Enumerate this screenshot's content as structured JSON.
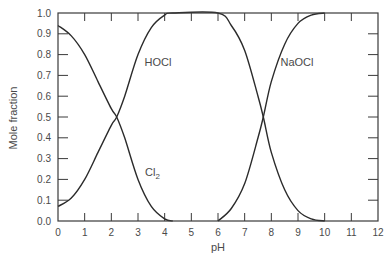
{
  "chart_data": {
    "type": "line",
    "title": "",
    "xlabel": "pH",
    "ylabel": "Mole fraction",
    "xlim": [
      0,
      12
    ],
    "ylim": [
      0.0,
      1.0
    ],
    "x_ticks": [
      "0",
      "1",
      "2",
      "3",
      "4",
      "5",
      "6",
      "7",
      "8",
      "9",
      "10",
      "11",
      "12"
    ],
    "y_ticks": [
      "0.0",
      "0.1",
      "0.2",
      "0.3",
      "0.4",
      "0.5",
      "0.6",
      "0.7",
      "0.8",
      "0.9",
      "1.0"
    ],
    "grid": false,
    "legend": "none (inline labels)",
    "annotations": [
      {
        "text": "HOCl",
        "x": 3.1,
        "y": 0.78
      },
      {
        "text": "NaOCl",
        "x": 8.3,
        "y": 0.78
      },
      {
        "text": "Cl2",
        "x": 3.1,
        "y": 0.27
      }
    ],
    "series": [
      {
        "name": "Cl2",
        "x": [
          0,
          0.5,
          1.0,
          1.5,
          2.0,
          2.2,
          2.5,
          3.0,
          3.5,
          4.0,
          4.3
        ],
        "values": [
          0.94,
          0.89,
          0.8,
          0.67,
          0.54,
          0.5,
          0.4,
          0.2,
          0.07,
          0.01,
          0.0
        ]
      },
      {
        "name": "HOCl",
        "x": [
          0,
          0.5,
          1.0,
          1.5,
          2.0,
          2.2,
          2.5,
          3.0,
          3.5,
          4.0,
          4.3,
          6.0,
          6.5,
          7.0,
          7.5,
          7.7,
          8.0,
          8.5,
          9.0,
          9.5,
          10.0
        ],
        "values": [
          0.07,
          0.11,
          0.2,
          0.33,
          0.46,
          0.5,
          0.6,
          0.8,
          0.93,
          0.99,
          1.0,
          1.0,
          0.94,
          0.82,
          0.6,
          0.5,
          0.33,
          0.15,
          0.05,
          0.01,
          0.0
        ]
      },
      {
        "name": "NaOCl",
        "x": [
          6.0,
          6.5,
          7.0,
          7.5,
          7.7,
          8.0,
          8.5,
          9.0,
          9.5,
          10.0
        ],
        "values": [
          0.0,
          0.06,
          0.18,
          0.4,
          0.5,
          0.67,
          0.85,
          0.95,
          0.99,
          1.0
        ]
      }
    ]
  },
  "axes": {
    "x_label": "pH",
    "y_label": "Mole fraction"
  },
  "labels": {
    "hocl": "HOCl",
    "naocl": "NaOCl",
    "cl2_main": "Cl",
    "cl2_sub": "2"
  },
  "colors": {
    "line": "#2b2b2b",
    "axis": "#3a3a3a",
    "text": "#4a4a4a"
  }
}
